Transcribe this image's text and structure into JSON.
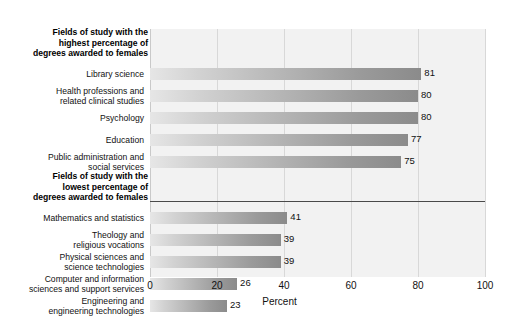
{
  "chart_data": {
    "type": "bar",
    "orientation": "horizontal",
    "title": "",
    "xlabel": "Percent",
    "ylabel": "",
    "xlim": [
      0,
      100
    ],
    "xticks": [
      0,
      20,
      40,
      60,
      80,
      100
    ],
    "xtick_labels": [
      "0",
      "20",
      "40",
      "60",
      "80",
      "100"
    ],
    "grid": true,
    "legend": "none",
    "value_labels": true,
    "groups": [
      {
        "header": "Fields of study with the\nhighest percentage of\ndegrees awarded to females",
        "header_lines": [
          "Fields of study with the",
          "highest percentage of",
          "degrees awarded to females"
        ],
        "categories": [
          "Library science",
          "Health professions and\nrelated clinical studies",
          "Psychology",
          "Education",
          "Public administration and\nsocial services"
        ],
        "category_lines": [
          [
            "Library science"
          ],
          [
            "Health professions and",
            "related clinical studies"
          ],
          [
            "Psychology"
          ],
          [
            "Education"
          ],
          [
            "Public administration and",
            "social services"
          ]
        ],
        "values": [
          81,
          80,
          80,
          77,
          75
        ]
      },
      {
        "header": "Fields of study with the\nlowest percentage of\ndegrees awarded to females",
        "header_lines": [
          "Fields of study with the",
          "lowest percentage of",
          "degrees awarded to females"
        ],
        "categories": [
          "Mathematics and statistics",
          "Theology and\nreligious vocations",
          "Physical sciences and\nscience technologies",
          "Computer and information\nsciences and support services",
          "Engineering and\nengineering technologies"
        ],
        "category_lines": [
          [
            "Mathematics and statistics"
          ],
          [
            "Theology and",
            "religious vocations"
          ],
          [
            "Physical sciences and",
            "science technologies"
          ],
          [
            "Computer and information",
            "sciences and support services"
          ],
          [
            "Engineering and",
            "engineering technologies"
          ]
        ],
        "values": [
          41,
          39,
          39,
          26,
          23
        ]
      }
    ],
    "categories": [
      "Library science",
      "Health professions and related clinical studies",
      "Psychology",
      "Education",
      "Public administration and social services",
      "Mathematics and statistics",
      "Theology and religious vocations",
      "Physical sciences and science technologies",
      "Computer and information sciences and support services",
      "Engineering and engineering technologies"
    ],
    "values": [
      81,
      80,
      80,
      77,
      75,
      41,
      39,
      39,
      26,
      23
    ],
    "colors": {
      "bar_gradient_start": "#e6e6e6",
      "bar_gradient_end": "#8b8b8b",
      "plot_background": "#f2f2f2",
      "gridline": "#d8d8d8",
      "divider": "#4a4a4a",
      "text": "#111111"
    }
  }
}
